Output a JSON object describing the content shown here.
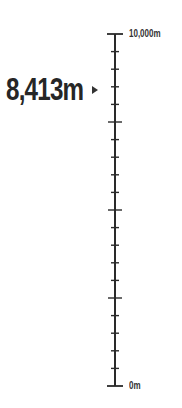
{
  "gauge": {
    "current_value": "8,413m",
    "current_numeric": 8413,
    "max_label": "10,000m",
    "min_label": "0m",
    "max": 10000,
    "min": 0,
    "major_divisions": 4,
    "minor_per_major": 5,
    "colors": {
      "ink": "#262626",
      "background": "#ffffff"
    }
  }
}
